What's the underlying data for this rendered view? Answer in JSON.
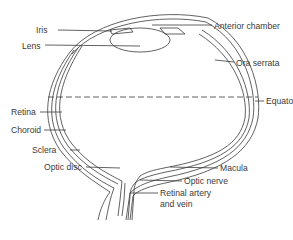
{
  "diagram": {
    "type": "anatomical cross-section",
    "line_color": "#3a3a3a",
    "labels": {
      "iris": "Iris",
      "lens": "Lens",
      "anterior_chamber": "Anterior chamber",
      "ora_serrata": "Ora serrata",
      "equator": "Equator",
      "retina": "Retina",
      "choroid": "Choroid",
      "sclera": "Sclera",
      "optic_disc": "Optic disc",
      "macula": "Macula",
      "optic_nerve": "Optic nerve",
      "retinal_vessels_line1": "Retinal artery",
      "retinal_vessels_line2": "and vein"
    }
  }
}
